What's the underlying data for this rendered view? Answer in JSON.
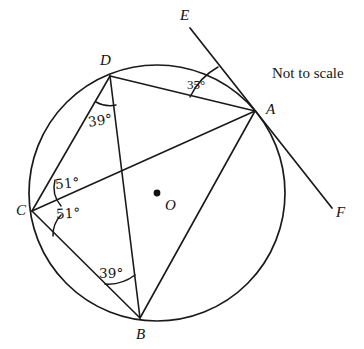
{
  "figure": {
    "note": "Not to scale",
    "stroke_color": "#1a1a1a",
    "background_color": "#ffffff"
  },
  "circle": {
    "center_label": "O",
    "center_x": 157,
    "center_y": 193,
    "radius": 128
  },
  "points": [
    {
      "label": "A",
      "x": 255,
      "y": 111,
      "label_x": 266,
      "label_y": 102,
      "on_circle": true
    },
    {
      "label": "B",
      "x": 140,
      "y": 318,
      "label_x": 136,
      "label_y": 327,
      "on_circle": true
    },
    {
      "label": "C",
      "x": 32,
      "y": 211,
      "label_x": 16,
      "label_y": 203,
      "on_circle": true
    },
    {
      "label": "D",
      "x": 110,
      "y": 76,
      "label_x": 100,
      "label_y": 53,
      "on_circle": true
    },
    {
      "label": "E",
      "x": 190,
      "y": 28,
      "label_x": 180,
      "label_y": 8,
      "on_circle": false
    },
    {
      "label": "F",
      "x": 332,
      "y": 208,
      "label_x": 336,
      "label_y": 205,
      "on_circle": false
    }
  ],
  "segments": [
    {
      "name": "chord-D-A",
      "from": "D",
      "to": "A"
    },
    {
      "name": "chord-D-C",
      "from": "D",
      "to": "C"
    },
    {
      "name": "chord-D-B",
      "from": "D",
      "to": "B"
    },
    {
      "name": "chord-C-B",
      "from": "C",
      "to": "B"
    },
    {
      "name": "chord-A-B",
      "from": "A",
      "to": "B"
    },
    {
      "name": "diameter-C-O-A",
      "from": "C",
      "to": "A"
    },
    {
      "name": "tangent-E-F",
      "from": "E",
      "to": "F"
    }
  ],
  "angles": [
    {
      "name": "angle-at-A-DAE",
      "vertex": "A",
      "value": "35°",
      "label_x": 187,
      "label_y": 78
    },
    {
      "name": "angle-at-D-CDB",
      "vertex": "D",
      "value": "39°",
      "label_x": 88,
      "label_y": 114
    },
    {
      "name": "angle-at-C-DCA",
      "vertex": "C",
      "value": "51°",
      "label_x": 55,
      "label_y": 177
    },
    {
      "name": "angle-at-C-ACB",
      "vertex": "C",
      "value": "51°",
      "label_x": 56,
      "label_y": 207
    },
    {
      "name": "angle-at-B-CBD",
      "vertex": "B",
      "value": "39°",
      "label_x": 99,
      "label_y": 267
    }
  ]
}
